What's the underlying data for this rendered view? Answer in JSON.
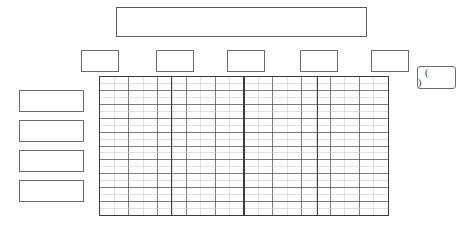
{
  "document": {
    "kind": "blank-form-worksheet",
    "background_color": "#ffffff",
    "line_color": "#58595b",
    "heavy_line_color": "#3b3c3e",
    "light_line_color": "#c9cacc"
  },
  "title_bar": {
    "value": "",
    "placeholder": ""
  },
  "header_chips": [
    {
      "name": "header-chip-1",
      "value": "",
      "left": 81
    },
    {
      "name": "header-chip-2",
      "value": "",
      "left": 156
    },
    {
      "name": "header-chip-3",
      "value": "",
      "left": 227
    },
    {
      "name": "header-chip-4",
      "value": "",
      "left": 300
    },
    {
      "name": "header-chip-5",
      "value": "",
      "left": 371
    }
  ],
  "note_box": {
    "value": "( )",
    "open_paren": "(",
    "close_paren": ")"
  },
  "row_label_boxes": [
    {
      "name": "row-label-1",
      "value": "",
      "top": 90
    },
    {
      "name": "row-label-2",
      "value": "",
      "top": 120
    },
    {
      "name": "row-label-3",
      "value": "",
      "top": 150
    },
    {
      "name": "row-label-4",
      "value": "",
      "top": 180
    }
  ],
  "grid": {
    "left": 99,
    "top": 76,
    "width": 290,
    "height": 140,
    "minor_columns": 20,
    "major_rows": 10,
    "minor_rows": 20,
    "section_dividers_x": [
      72,
      145,
      219
    ],
    "section_count": 4,
    "cells": []
  }
}
